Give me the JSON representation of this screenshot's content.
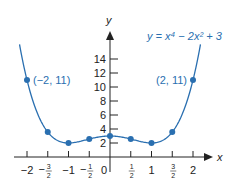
{
  "chart_data": {
    "type": "line",
    "title": "",
    "equation_label": "y = x⁴ − 2x² + 3",
    "function": {
      "coeffs_x4": 1,
      "coeffs_x2": -2,
      "const": 3
    },
    "xlabel": "x",
    "ylabel": "y",
    "xlim": [
      -2.18,
      2.18
    ],
    "ylim": [
      0,
      16
    ],
    "grid": false,
    "x_ticks": [
      {
        "value": -2,
        "label": "−2"
      },
      {
        "value": -1.5,
        "label": "−",
        "num": "3",
        "den": "2"
      },
      {
        "value": -1,
        "label": "−1"
      },
      {
        "value": -0.5,
        "label": "−",
        "num": "1",
        "den": "2"
      },
      {
        "value": 0,
        "label": "0"
      },
      {
        "value": 0.5,
        "label": "",
        "num": "1",
        "den": "2"
      },
      {
        "value": 1,
        "label": "1"
      },
      {
        "value": 1.5,
        "label": "",
        "num": "3",
        "den": "2"
      },
      {
        "value": 2,
        "label": "2"
      }
    ],
    "y_ticks": [
      {
        "value": 2,
        "label": "2"
      },
      {
        "value": 4,
        "label": "4"
      },
      {
        "value": 6,
        "label": "6"
      },
      {
        "value": 8,
        "label": "8"
      },
      {
        "value": 10,
        "label": "10"
      },
      {
        "value": 12,
        "label": "12"
      },
      {
        "value": 14,
        "label": "14"
      }
    ],
    "points": [
      {
        "x": -2,
        "y": 11,
        "label": "(−2, 11)"
      },
      {
        "x": -1.5,
        "y": 3.5625
      },
      {
        "x": -1,
        "y": 2
      },
      {
        "x": -0.5,
        "y": 2.5625
      },
      {
        "x": 0,
        "y": 3
      },
      {
        "x": 0.5,
        "y": 2.5625
      },
      {
        "x": 1,
        "y": 2
      },
      {
        "x": 1.5,
        "y": 3.5625
      },
      {
        "x": 2,
        "y": 11,
        "label": "(2, 11)"
      }
    ],
    "colors": {
      "curve": "#2a6fb0",
      "axis": "#222222"
    }
  }
}
